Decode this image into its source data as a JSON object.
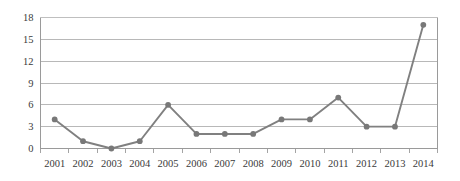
{
  "chart_data": {
    "type": "line",
    "title": "",
    "xlabel": "",
    "ylabel": "",
    "categories": [
      "2001",
      "2002",
      "2003",
      "2004",
      "2005",
      "2006",
      "2007",
      "2008",
      "2009",
      "2010",
      "2011",
      "2012",
      "2013",
      "2014"
    ],
    "values": [
      4,
      1,
      0,
      1,
      6,
      2,
      2,
      2,
      4,
      4,
      7,
      3,
      3,
      17
    ],
    "series": [
      {
        "name": "",
        "values": [
          4,
          1,
          0,
          1,
          6,
          2,
          2,
          2,
          4,
          4,
          7,
          3,
          3,
          17
        ]
      }
    ],
    "ylim": [
      0,
      18
    ],
    "yticks": [
      0,
      3,
      6,
      9,
      12,
      15,
      18
    ],
    "ytick_labels": [
      "0",
      "3",
      "6",
      "9",
      "12",
      "15",
      "18"
    ],
    "xtick_labels": [
      "2001",
      "2002",
      "2003",
      "2004",
      "2005",
      "2006",
      "2007",
      "2008",
      "2009",
      "2010",
      "2011",
      "2012",
      "2013",
      "2014"
    ],
    "grid": true,
    "grid_axis": "y",
    "legend": false,
    "legend_position": "none",
    "marker": "circle",
    "colors": {
      "series": "#808080",
      "marker": "#787878",
      "gridline": "#a6a6a6",
      "axis": "#9a9a9a",
      "tick_label": "#3a3a3a",
      "background": "#ffffff"
    },
    "annotations": []
  }
}
